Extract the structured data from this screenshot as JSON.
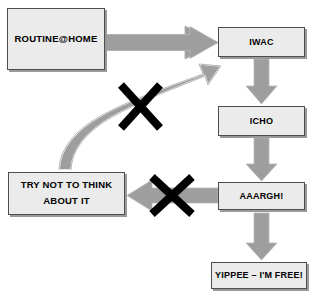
{
  "diagram": {
    "type": "flowchart",
    "title": "",
    "colors": {
      "box_fill": "#ebebeb",
      "box_border": "#4d4d4d",
      "box_shadow": "#9a9a9a",
      "arrow_fill": "#9e9e9e",
      "arrow_edge": "#bdbdbd",
      "cross_mark": "#000000",
      "background": "#ffffff",
      "text": "#000000"
    },
    "nodes": [
      {
        "id": "routine",
        "label": "ROUTINE@HOME",
        "lines": [
          "ROUTINE@HOME"
        ]
      },
      {
        "id": "iwac",
        "label": "IWAC",
        "lines": [
          "IWAC"
        ]
      },
      {
        "id": "icho",
        "label": "ICHO",
        "lines": [
          "ICHO"
        ]
      },
      {
        "id": "aaargh",
        "label": "AAARGH!",
        "lines": [
          "AAARGH!"
        ]
      },
      {
        "id": "yippee",
        "label": "YIPPEE – I'M FREE!",
        "lines": [
          "YIPPEE – I'M FREE!"
        ]
      },
      {
        "id": "trynot",
        "label": "TRY NOT TO THINK ABOUT IT",
        "lines": [
          "TRY NOT TO THINK",
          "ABOUT IT"
        ]
      }
    ],
    "edges": [
      {
        "id": "routine-to-iwac",
        "from": "routine",
        "to": "iwac",
        "style": "block-arrow",
        "direction": "right",
        "blocked": false
      },
      {
        "id": "iwac-to-icho",
        "from": "iwac",
        "to": "icho",
        "style": "block-arrow",
        "direction": "down",
        "blocked": false
      },
      {
        "id": "icho-to-aaargh",
        "from": "icho",
        "to": "aaargh",
        "style": "block-arrow",
        "direction": "down",
        "blocked": false
      },
      {
        "id": "aaargh-to-yippee",
        "from": "aaargh",
        "to": "yippee",
        "style": "block-arrow",
        "direction": "down",
        "blocked": false
      },
      {
        "id": "aaargh-to-trynot",
        "from": "aaargh",
        "to": "trynot",
        "style": "block-arrow",
        "direction": "left",
        "blocked": true
      },
      {
        "id": "trynot-to-iwac",
        "from": "trynot",
        "to": "iwac",
        "style": "curved-arrow",
        "direction": "up-right",
        "blocked": true
      }
    ],
    "cross_marks": [
      {
        "id": "cross-on-curve",
        "on_edge": "trynot-to-iwac"
      },
      {
        "id": "cross-on-left-arrow",
        "on_edge": "aaargh-to-trynot"
      }
    ]
  }
}
